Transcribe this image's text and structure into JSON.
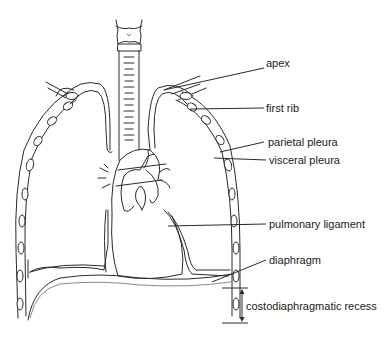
{
  "diagram": {
    "labels": [
      {
        "id": "apex",
        "text": "apex",
        "x": 266,
        "y": 62
      },
      {
        "id": "first-rib",
        "text": "first rib",
        "x": 266,
        "y": 102
      },
      {
        "id": "parietal-pleura",
        "text": "parietal pleura",
        "x": 268,
        "y": 136
      },
      {
        "id": "visceral-pleura",
        "text": "visceral pleura",
        "x": 269,
        "y": 154
      },
      {
        "id": "pulmonary-ligament",
        "text": "pulmonary ligament",
        "x": 269,
        "y": 218
      },
      {
        "id": "diaphragm",
        "text": "diaphragm",
        "x": 269,
        "y": 256
      },
      {
        "id": "costodiaphragmatic-recess",
        "text": "costodiaphragmatic recess",
        "x": 246,
        "y": 296
      }
    ],
    "colors": {
      "stroke": "#2a2a2a",
      "diaphragm_outline": "#8a8a8a",
      "background": "#ffffff",
      "text": "#1a1a1a"
    }
  }
}
